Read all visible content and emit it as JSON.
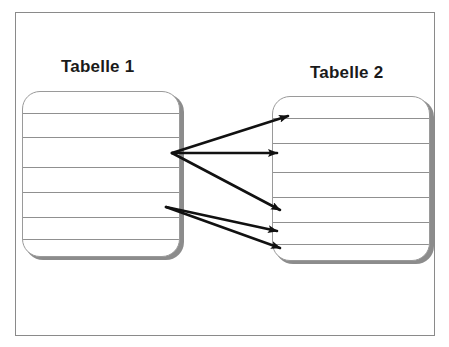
{
  "diagram": {
    "type": "table-relationship",
    "tables": [
      {
        "id": "t1",
        "title": "Tabelle 1",
        "rows": 7
      },
      {
        "id": "t2",
        "title": "Tabelle 2",
        "rows": 7
      }
    ],
    "arrows": [
      {
        "from": "Tabelle 1 row 2",
        "to": "Tabelle 2 row 1"
      },
      {
        "from": "Tabelle 1 row 2",
        "to": "Tabelle 2 row 2"
      },
      {
        "from": "Tabelle 1 row 2",
        "to": "Tabelle 2 row 4"
      },
      {
        "from": "Tabelle 1 row 5",
        "to": "Tabelle 2 row 5"
      },
      {
        "from": "Tabelle 1 row 5",
        "to": "Tabelle 2 row 6"
      }
    ],
    "colors": {
      "frame_border": "#8a8a8a",
      "table_border": "#9a9a9a",
      "table_shadow": "#8c8c8c",
      "row_lines": "#909090",
      "arrow": "#111111",
      "title_text": "#1a1a1a"
    }
  }
}
